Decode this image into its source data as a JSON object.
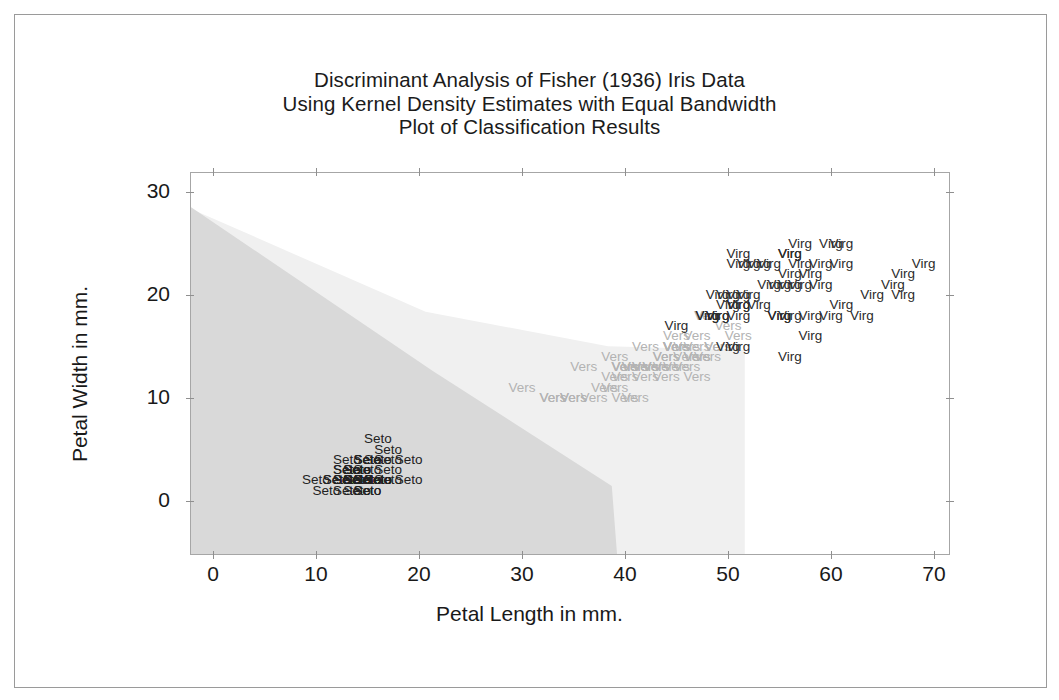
{
  "window": {
    "background": "#ffffff",
    "frame_color": "#9a9a9a"
  },
  "title": {
    "line1": "Discriminant Analysis of Fisher (1936) Iris Data",
    "line2": "Using Kernel Density Estimates with Equal Bandwidth",
    "line3": "Plot of Classification Results"
  },
  "axes": {
    "x_title": "Petal Length in mm.",
    "y_title": "Petal Width in mm.",
    "x_ticklabels": [
      "0",
      "10",
      "20",
      "30",
      "40",
      "50",
      "60",
      "70"
    ],
    "y_ticklabels": [
      "0",
      "10",
      "20",
      "30"
    ]
  },
  "colors": {
    "setosa_region": "#d9d9d9",
    "versicolor_region": "#f0f0f0",
    "virginica_region": "#ffffff",
    "setosa_text": "#222222",
    "versicolor_text": "#b3b3b3",
    "virginica_text": "#2b2b2b",
    "axis_line": "#a6a6a6"
  },
  "chart_data": {
    "type": "scatter",
    "title": "Discriminant Analysis of Fisher (1936) Iris Data\nUsing Kernel Density Estimates with Equal Bandwidth\nPlot of Classification Results",
    "xlabel": "Petal Length in mm.",
    "ylabel": "Petal Width in mm.",
    "xlim": [
      -2,
      72
    ],
    "ylim": [
      -4,
      32
    ],
    "xticks": [
      0,
      10,
      20,
      30,
      40,
      50,
      60,
      70
    ],
    "yticks": [
      0,
      10,
      20,
      30
    ],
    "grid": false,
    "legend": "none",
    "point_marker": "class-name-text",
    "annotations": [
      "Shaded darker gray region = classified Setosa",
      "Shaded light gray region = classified Versicolor",
      "Unshaded (white) region = classified Virginica"
    ],
    "regions": [
      {
        "name": "Setosa",
        "fill": "#d9d9d9"
      },
      {
        "name": "Versicolor",
        "fill": "#f0f0f0"
      },
      {
        "name": "Virginica",
        "fill": "#ffffff"
      }
    ],
    "series": [
      {
        "name": "Seto",
        "label": "Seto",
        "color": "#222222",
        "points": [
          [
            14,
            2
          ],
          [
            14,
            2
          ],
          [
            13,
            2
          ],
          [
            15,
            2
          ],
          [
            14,
            2
          ],
          [
            17,
            4
          ],
          [
            14,
            3
          ],
          [
            15,
            2
          ],
          [
            14,
            2
          ],
          [
            15,
            1
          ],
          [
            15,
            2
          ],
          [
            16,
            2
          ],
          [
            14,
            1
          ],
          [
            11,
            1
          ],
          [
            12,
            2
          ],
          [
            15,
            4
          ],
          [
            13,
            4
          ],
          [
            14,
            3
          ],
          [
            17,
            3
          ],
          [
            15,
            3
          ],
          [
            17,
            2
          ],
          [
            15,
            4
          ],
          [
            10,
            2
          ],
          [
            17,
            5
          ],
          [
            19,
            2
          ],
          [
            16,
            2
          ],
          [
            16,
            4
          ],
          [
            15,
            2
          ],
          [
            14,
            2
          ],
          [
            16,
            2
          ],
          [
            16,
            2
          ],
          [
            15,
            4
          ],
          [
            15,
            1
          ],
          [
            14,
            2
          ],
          [
            15,
            2
          ],
          [
            12,
            2
          ],
          [
            13,
            1
          ],
          [
            14,
            2
          ],
          [
            13,
            2
          ],
          [
            15,
            2
          ],
          [
            13,
            3
          ],
          [
            13,
            3
          ],
          [
            13,
            2
          ],
          [
            16,
            6
          ],
          [
            19,
            4
          ],
          [
            14,
            3
          ],
          [
            16,
            2
          ],
          [
            14,
            2
          ],
          [
            15,
            2
          ],
          [
            14,
            2
          ]
        ]
      },
      {
        "name": "Vers",
        "label": "Vers",
        "color": "#b3b3b3",
        "points": [
          [
            47,
            14
          ],
          [
            45,
            15
          ],
          [
            49,
            15
          ],
          [
            40,
            13
          ],
          [
            46,
            15
          ],
          [
            45,
            13
          ],
          [
            47,
            16
          ],
          [
            33,
            10
          ],
          [
            46,
            13
          ],
          [
            39,
            14
          ],
          [
            35,
            10
          ],
          [
            42,
            15
          ],
          [
            40,
            10
          ],
          [
            47,
            14
          ],
          [
            36,
            13
          ],
          [
            44,
            14
          ],
          [
            45,
            15
          ],
          [
            41,
            10
          ],
          [
            45,
            15
          ],
          [
            39,
            11
          ],
          [
            48,
            18
          ],
          [
            40,
            13
          ],
          [
            49,
            15
          ],
          [
            47,
            12
          ],
          [
            43,
            13
          ],
          [
            44,
            14
          ],
          [
            48,
            14
          ],
          [
            50,
            17
          ],
          [
            45,
            15
          ],
          [
            35,
            10
          ],
          [
            38,
            11
          ],
          [
            37,
            10
          ],
          [
            39,
            12
          ],
          [
            51,
            16
          ],
          [
            45,
            15
          ],
          [
            45,
            16
          ],
          [
            47,
            15
          ],
          [
            44,
            13
          ],
          [
            41,
            13
          ],
          [
            40,
            13
          ],
          [
            44,
            12
          ],
          [
            46,
            14
          ],
          [
            40,
            12
          ],
          [
            33,
            10
          ],
          [
            42,
            13
          ],
          [
            42,
            12
          ],
          [
            42,
            13
          ],
          [
            43,
            13
          ],
          [
            30,
            11
          ],
          [
            41,
            13
          ]
        ]
      },
      {
        "name": "Virg",
        "label": "Virg",
        "color": "#2b2b2b",
        "points": [
          [
            60,
            25
          ],
          [
            51,
            19
          ],
          [
            59,
            21
          ],
          [
            56,
            18
          ],
          [
            58,
            22
          ],
          [
            66,
            21
          ],
          [
            45,
            17
          ],
          [
            63,
            18
          ],
          [
            58,
            18
          ],
          [
            61,
            25
          ],
          [
            51,
            20
          ],
          [
            53,
            19
          ],
          [
            55,
            21
          ],
          [
            50,
            20
          ],
          [
            51,
            24
          ],
          [
            53,
            23
          ],
          [
            55,
            18
          ],
          [
            67,
            22
          ],
          [
            69,
            23
          ],
          [
            50,
            15
          ],
          [
            57,
            23
          ],
          [
            49,
            20
          ],
          [
            67,
            20
          ],
          [
            49,
            18
          ],
          [
            57,
            21
          ],
          [
            60,
            18
          ],
          [
            48,
            18
          ],
          [
            49,
            18
          ],
          [
            56,
            21
          ],
          [
            58,
            16
          ],
          [
            61,
            19
          ],
          [
            64,
            20
          ],
          [
            56,
            22
          ],
          [
            51,
            15
          ],
          [
            56,
            14
          ],
          [
            61,
            23
          ],
          [
            56,
            24
          ],
          [
            55,
            18
          ],
          [
            48,
            18
          ],
          [
            54,
            21
          ],
          [
            56,
            24
          ],
          [
            51,
            23
          ],
          [
            51,
            19
          ],
          [
            59,
            23
          ],
          [
            57,
            25
          ],
          [
            52,
            23
          ],
          [
            50,
            19
          ],
          [
            52,
            20
          ],
          [
            54,
            23
          ],
          [
            51,
            18
          ]
        ]
      }
    ]
  }
}
